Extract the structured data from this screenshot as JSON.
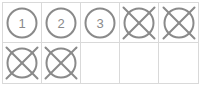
{
  "widget": {
    "title": "tally-grid",
    "columns": 5,
    "rows": 2,
    "cells": [
      {
        "state": "numbered",
        "label": "1"
      },
      {
        "state": "numbered",
        "label": "2"
      },
      {
        "state": "numbered",
        "label": "3"
      },
      {
        "state": "crossed"
      },
      {
        "state": "crossed"
      },
      {
        "state": "crossed"
      },
      {
        "state": "crossed"
      },
      {
        "state": "empty"
      },
      {
        "state": "empty"
      },
      {
        "state": "empty"
      }
    ],
    "colors": {
      "background": "#ffffff",
      "grid_border": "#d9d9d9",
      "mark_stroke": "#8a8a8a",
      "number_text": "#8a8a8a"
    }
  }
}
